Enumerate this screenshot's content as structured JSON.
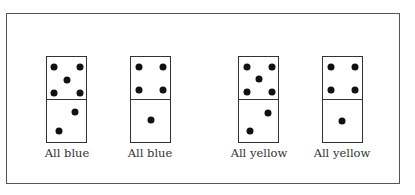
{
  "figure": {
    "dominoes": [
      {
        "label": "All blue",
        "top_pips": 5,
        "bottom_pips": 2
      },
      {
        "label": "All blue",
        "top_pips": 4,
        "bottom_pips": 1
      },
      {
        "label": "All yellow",
        "top_pips": 5,
        "bottom_pips": 2
      },
      {
        "label": "All yellow",
        "top_pips": 4,
        "bottom_pips": 1
      }
    ]
  }
}
